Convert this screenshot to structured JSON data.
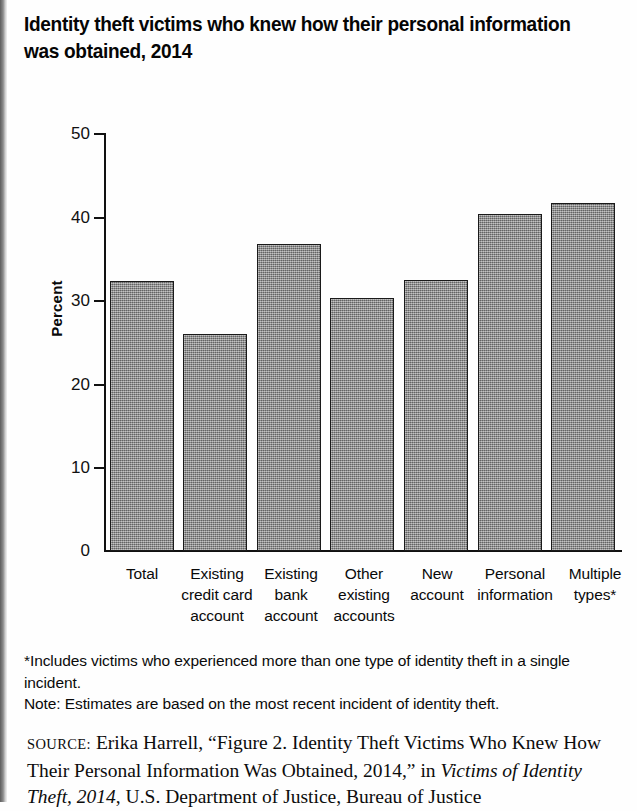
{
  "title": "Identity theft victims who knew how their personal information was obtained, 2014",
  "chart_data": {
    "type": "bar",
    "title": "Identity theft victims who knew how their personal information was obtained, 2014",
    "categories": [
      "Total",
      "Existing credit card account",
      "Existing bank account",
      "Other existing accounts",
      "New account",
      "Personal information",
      "Multiple types*"
    ],
    "values": [
      32.3,
      26.0,
      36.8,
      30.3,
      32.5,
      40.4,
      41.7
    ],
    "xlabel": "",
    "ylabel": "Percent",
    "ylim": [
      0,
      50
    ],
    "yticks": [
      0,
      10,
      20,
      30,
      40,
      50
    ],
    "ytick_labels": [
      "0",
      "10",
      "20",
      "30",
      "40",
      "50"
    ],
    "grid": false,
    "legend": "none",
    "bar_color": "#8a8a8a",
    "bar_edge_color": "#1a1a1a"
  },
  "axis": {
    "y_title": "Percent",
    "tick_labels": [
      "50",
      "40",
      "30",
      "20",
      "10",
      "0"
    ]
  },
  "category_lines": [
    [
      "Total"
    ],
    [
      "Existing",
      "credit card",
      "account"
    ],
    [
      "Existing",
      "bank",
      "account"
    ],
    [
      "Other",
      "existing",
      "accounts"
    ],
    [
      "New",
      "account"
    ],
    [
      "Personal",
      "information"
    ],
    [
      "Multiple",
      "types*"
    ]
  ],
  "notes": {
    "footnote": "*Includes victims who experienced more than one type of identity theft in a single incident.",
    "note": "Note: Estimates are based on the most recent incident of identity theft."
  },
  "source": {
    "label": "SOURCE:",
    "part1": " Erika Harrell, “Figure 2. Identity Theft Victims Who Knew How Their Personal Information Was Obtained, 2014,” in ",
    "italic1": "Victims of Identity Theft, 2014",
    "part2": ", U.S. Department of Justice, Bureau of Justice"
  }
}
